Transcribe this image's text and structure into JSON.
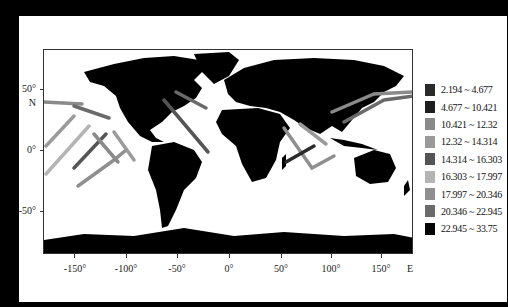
{
  "map": {
    "type": "world track map (equirectangular)",
    "background": "#000000",
    "land_color": "#000000",
    "ocean_color": "#ffffff",
    "y_axis": {
      "ticks": [
        {
          "label": "50°",
          "lat": 50
        },
        {
          "label": "0°",
          "lat": 0
        },
        {
          "label": "-50°",
          "lat": -50
        }
      ],
      "unit_label": "N"
    },
    "x_axis": {
      "ticks": [
        {
          "label": "-150°",
          "lon": -150
        },
        {
          "label": "-100°",
          "lon": -100
        },
        {
          "label": "-50°",
          "lon": -50
        },
        {
          "label": "0°",
          "lon": 0
        },
        {
          "label": "50°",
          "lon": 50
        },
        {
          "label": "100°",
          "lon": 100
        },
        {
          "label": "150°",
          "lon": 150
        }
      ],
      "unit_label": "E"
    },
    "legend": {
      "items": [
        {
          "label": "2.194 ~ 4.677",
          "color": "#2a2a2a"
        },
        {
          "label": "4.677 ~ 10.421",
          "color": "#1e1e1e"
        },
        {
          "label": "10.421 ~ 12.32",
          "color": "#8a8a8a"
        },
        {
          "label": "12.32 ~ 14.314",
          "color": "#9a9a9a"
        },
        {
          "label": "14.314 ~ 16.303",
          "color": "#555555"
        },
        {
          "label": "16.303 ~ 17.997",
          "color": "#b4b4b4"
        },
        {
          "label": "17.997 ~ 20.346",
          "color": "#8f8f8f"
        },
        {
          "label": "20.346 ~ 22.945",
          "color": "#6a6a6a"
        },
        {
          "label": "22.945 ~ 33.75",
          "color": "#050505"
        }
      ]
    }
  }
}
